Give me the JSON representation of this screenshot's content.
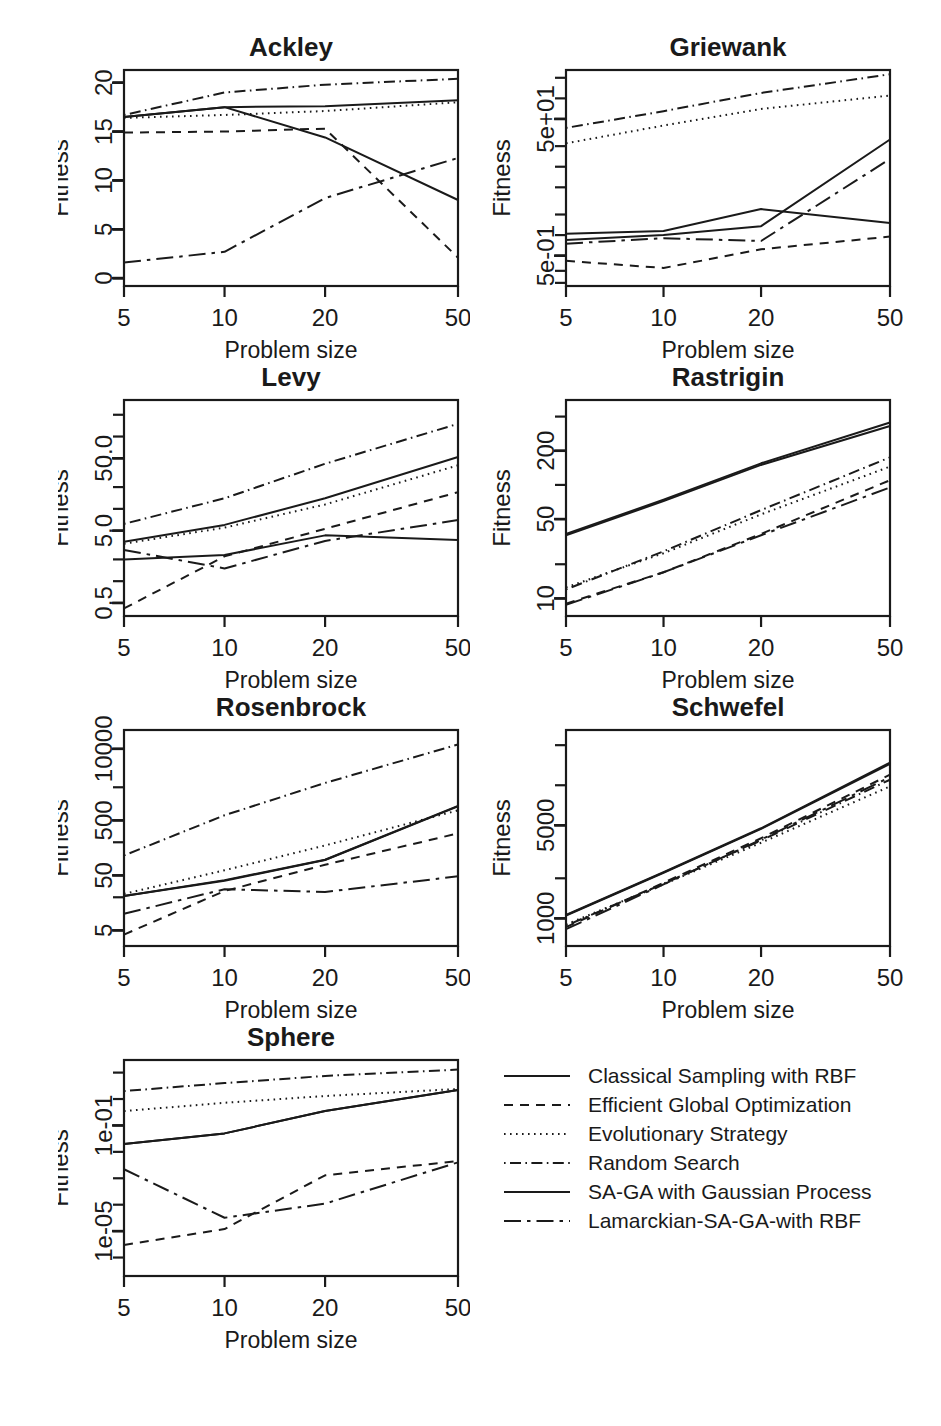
{
  "figure": {
    "width": 941,
    "height": 1426,
    "background": "#ffffff",
    "ink": "#1a1a1a",
    "xlabel": "Problem size",
    "ylabel": "Fitness",
    "x_categories": [
      "5",
      "10",
      "20",
      "50"
    ],
    "x_values": [
      5,
      10,
      20,
      50
    ]
  },
  "series_styles": [
    {
      "name": "Classical Sampling with RBF",
      "dash": "none",
      "pattern": "solid"
    },
    {
      "name": "Efficient Global Optimization",
      "dash": "8,7",
      "pattern": "dashed"
    },
    {
      "name": "Evolutionary Strategy",
      "dash": "2,5",
      "pattern": "dotted"
    },
    {
      "name": "Random Search",
      "dash": "2,5,10,5",
      "pattern": "dotdash"
    },
    {
      "name": "SA-GA with Gaussian Process",
      "dash": "none",
      "pattern": "longsolid"
    },
    {
      "name": "Lamarckian-SA-GA-with RBF",
      "dash": "16,6,3,6",
      "pattern": "twodash"
    }
  ],
  "legend": {
    "items": [
      "Classical Sampling with RBF",
      "Efficient Global Optimization",
      "Evolutionary Strategy",
      "Random Search",
      "SA-GA with Gaussian Process",
      "Lamarckian-SA-GA-with RBF"
    ]
  },
  "chart_data": [
    {
      "type": "line",
      "title": "Ackley",
      "xlabel": "Problem size",
      "ylabel": "Fitness",
      "x": [
        5,
        10,
        20,
        50
      ],
      "xscale": "log",
      "xticks": [
        5,
        10,
        20,
        50
      ],
      "xticklabels": [
        "5",
        "10",
        "20",
        "50"
      ],
      "yscale": "linear",
      "ylim": [
        -0.8,
        21.3
      ],
      "yticks": [
        0,
        5,
        10,
        15,
        20
      ],
      "yticklabels": [
        "0",
        "5",
        "10",
        "15",
        "20"
      ],
      "grid": false,
      "series": [
        {
          "name": "Classical Sampling with RBF",
          "values": [
            16.5,
            17.5,
            17.6,
            18.2
          ]
        },
        {
          "name": "Efficient Global Optimization",
          "values": [
            14.9,
            15.0,
            15.3,
            2.1
          ]
        },
        {
          "name": "Evolutionary Strategy",
          "values": [
            16.4,
            16.7,
            17.1,
            18.0
          ]
        },
        {
          "name": "Random Search",
          "values": [
            16.7,
            19.0,
            19.8,
            20.4
          ]
        },
        {
          "name": "SA-GA with Gaussian Process",
          "values": [
            16.5,
            17.5,
            14.4,
            8.0
          ]
        },
        {
          "name": "Lamarckian-SA-GA-with RBF",
          "values": [
            1.6,
            2.7,
            8.2,
            12.3
          ]
        }
      ]
    },
    {
      "type": "line",
      "title": "Griewank",
      "xlabel": "Problem size",
      "ylabel": "Fitness",
      "x": [
        5,
        10,
        20,
        50
      ],
      "xscale": "log",
      "xticks": [
        5,
        10,
        20,
        50
      ],
      "xticklabels": [
        "5",
        "10",
        "20",
        "50"
      ],
      "yscale": "log",
      "ylim": [
        0.18,
        260
      ],
      "yticks": [
        0.5,
        50
      ],
      "yticklabels": [
        "5e-01",
        "5e+01"
      ],
      "minor_yticks": [
        0.2,
        0.3,
        0.5,
        1,
        2,
        5,
        10,
        20,
        50,
        100,
        200
      ],
      "grid": false,
      "series": [
        {
          "name": "Classical Sampling with RBF",
          "values": [
            1.05,
            1.15,
            2.4,
            1.5
          ]
        },
        {
          "name": "Efficient Global Optimization",
          "values": [
            0.42,
            0.33,
            0.62,
            0.95
          ]
        },
        {
          "name": "Evolutionary Strategy",
          "values": [
            22.0,
            40.0,
            70.0,
            110.0
          ]
        },
        {
          "name": "Random Search",
          "values": [
            37.0,
            65.0,
            120.0,
            225.0
          ]
        },
        {
          "name": "SA-GA with Gaussian Process",
          "values": [
            0.85,
            1.0,
            1.35,
            25.0
          ]
        },
        {
          "name": "Lamarckian-SA-GA-with RBF",
          "values": [
            0.75,
            0.9,
            0.82,
            13.0
          ]
        }
      ]
    },
    {
      "type": "line",
      "title": "Levy",
      "xlabel": "Problem size",
      "ylabel": "Fitness",
      "x": [
        5,
        10,
        20,
        50
      ],
      "xscale": "log",
      "xticks": [
        5,
        10,
        20,
        50
      ],
      "xticklabels": [
        "5",
        "10",
        "20",
        "50"
      ],
      "yscale": "log",
      "ylim": [
        0.33,
        320
      ],
      "yticks": [
        0.5,
        5.0,
        50.0
      ],
      "yticklabels": [
        "0.5",
        "5.0",
        "50.0"
      ],
      "minor_yticks": [
        0.5,
        1,
        2,
        5,
        10,
        20,
        50,
        100,
        200
      ],
      "grid": false,
      "series": [
        {
          "name": "Classical Sampling with RBF",
          "values": [
            2.0,
            2.3,
            4.3,
            3.7
          ]
        },
        {
          "name": "Efficient Global Optimization",
          "values": [
            0.42,
            2.2,
            5.3,
            17.0
          ]
        },
        {
          "name": "Evolutionary Strategy",
          "values": [
            3.3,
            5.5,
            11.5,
            40.0
          ]
        },
        {
          "name": "Random Search",
          "values": [
            6.2,
            14.0,
            42.0,
            150.0
          ]
        },
        {
          "name": "SA-GA with Gaussian Process",
          "values": [
            3.5,
            6.0,
            14.0,
            52.0
          ]
        },
        {
          "name": "Lamarckian-SA-GA-with RBF",
          "values": [
            2.7,
            1.5,
            3.6,
            7.0
          ]
        }
      ]
    },
    {
      "type": "line",
      "title": "Rastrigin",
      "xlabel": "Problem size",
      "ylabel": "Fitness",
      "x": [
        5,
        10,
        20,
        50
      ],
      "xscale": "log",
      "xticks": [
        5,
        10,
        20,
        50
      ],
      "xticklabels": [
        "5",
        "10",
        "20",
        "50"
      ],
      "yscale": "log",
      "ylim": [
        7.0,
        560
      ],
      "yticks": [
        10,
        50,
        200
      ],
      "yticklabels": [
        "10",
        "50",
        "200"
      ],
      "minor_yticks": [
        10,
        20,
        50,
        100,
        200,
        400
      ],
      "grid": false,
      "series": [
        {
          "name": "Classical Sampling with RBF",
          "values": [
            36.0,
            72.0,
            150.0,
            330.0
          ]
        },
        {
          "name": "Efficient Global Optimization",
          "values": [
            9.0,
            17.0,
            37.0,
            110.0
          ]
        },
        {
          "name": "Evolutionary Strategy",
          "values": [
            12.5,
            25.0,
            55.0,
            145.0
          ]
        },
        {
          "name": "Random Search",
          "values": [
            12.0,
            26.0,
            60.0,
            175.0
          ]
        },
        {
          "name": "SA-GA with Gaussian Process",
          "values": [
            37.0,
            74.0,
            155.0,
            355.0
          ]
        },
        {
          "name": "Lamarckian-SA-GA-with RBF",
          "values": [
            8.8,
            17.0,
            36.0,
            95.0
          ]
        }
      ]
    },
    {
      "type": "line",
      "title": "Rosenbrock",
      "xlabel": "Problem size",
      "ylabel": "Fitness",
      "x": [
        5,
        10,
        20,
        50
      ],
      "xscale": "log",
      "xticks": [
        5,
        10,
        20,
        50
      ],
      "xticklabels": [
        "5",
        "10",
        "20",
        "50"
      ],
      "yscale": "log",
      "ylim": [
        2.6,
        22000
      ],
      "yticks": [
        5,
        50,
        500,
        10000
      ],
      "yticklabels": [
        "5",
        "50",
        "500",
        "10000"
      ],
      "minor_yticks": [
        5,
        20,
        50,
        200,
        500,
        2000,
        10000
      ],
      "grid": false,
      "series": [
        {
          "name": "Classical Sampling with RBF",
          "values": [
            21.0,
            40.0,
            95.0,
            900.0
          ]
        },
        {
          "name": "Efficient Global Optimization",
          "values": [
            4.2,
            26.0,
            78.0,
            290.0
          ]
        },
        {
          "name": "Evolutionary Strategy",
          "values": [
            23.0,
            62.0,
            175.0,
            760.0
          ]
        },
        {
          "name": "Random Search",
          "values": [
            115.0,
            620.0,
            2400.0,
            12000.0
          ]
        },
        {
          "name": "SA-GA with Gaussian Process",
          "values": [
            21.0,
            41.0,
            96.0,
            920.0
          ]
        },
        {
          "name": "Lamarckian-SA-GA-with RBF",
          "values": [
            10.0,
            28.0,
            25.0,
            48.0
          ]
        }
      ]
    },
    {
      "type": "line",
      "title": "Schwefel",
      "xlabel": "Problem size",
      "ylabel": "Fitness",
      "x": [
        5,
        10,
        20,
        50
      ],
      "xscale": "log",
      "xticks": [
        5,
        10,
        20,
        50
      ],
      "xticklabels": [
        "5",
        "10",
        "20",
        "50"
      ],
      "yscale": "log",
      "ylim": [
        620,
        26000
      ],
      "yticks": [
        1000,
        5000
      ],
      "yticklabels": [
        "1000",
        "5000"
      ],
      "minor_yticks": [
        1000,
        2000,
        5000,
        10000,
        20000
      ],
      "grid": false,
      "series": [
        {
          "name": "Classical Sampling with RBF",
          "values": [
            1050,
            2200,
            4700,
            14500
          ]
        },
        {
          "name": "Efficient Global Optimization",
          "values": [
            860,
            1850,
            4000,
            12000
          ]
        },
        {
          "name": "Evolutionary Strategy",
          "values": [
            900,
            1800,
            3700,
            9800
          ]
        },
        {
          "name": "Random Search",
          "values": [
            880,
            1820,
            3850,
            11000
          ]
        },
        {
          "name": "SA-GA with Gaussian Process",
          "values": [
            1060,
            2220,
            4750,
            14800
          ]
        },
        {
          "name": "Lamarckian-SA-GA-with RBF",
          "values": [
            830,
            1800,
            3900,
            11500
          ]
        }
      ]
    },
    {
      "type": "line",
      "title": "Sphere",
      "xlabel": "Problem size",
      "ylabel": "Fitness",
      "x": [
        5,
        10,
        20,
        50
      ],
      "xscale": "log",
      "xticks": [
        5,
        10,
        20,
        50
      ],
      "xticklabels": [
        "5",
        "10",
        "20",
        "50"
      ],
      "yscale": "log",
      "ylim": [
        2e-07,
        30
      ],
      "yticks": [
        1e-05,
        0.1
      ],
      "yticklabels": [
        "1e-05",
        "1e-01"
      ],
      "minor_yticks": [
        1e-06,
        1e-05,
        0.0001,
        0.001,
        0.01,
        0.1,
        1,
        10
      ],
      "grid": false,
      "series": [
        {
          "name": "Classical Sampling with RBF",
          "values": [
            0.02,
            0.05,
            0.35,
            2.2
          ]
        },
        {
          "name": "Efficient Global Optimization",
          "values": [
            3e-06,
            1.2e-05,
            0.0013,
            0.0045
          ]
        },
        {
          "name": "Evolutionary Strategy",
          "values": [
            0.35,
            0.72,
            1.3,
            2.4
          ]
        },
        {
          "name": "Random Search",
          "values": [
            2.0,
            4.0,
            7.5,
            13.0
          ]
        },
        {
          "name": "SA-GA with Gaussian Process",
          "values": [
            0.02,
            0.05,
            0.35,
            2.2
          ]
        },
        {
          "name": "Lamarckian-SA-GA-with RBF",
          "values": [
            0.0022,
            3.2e-05,
            0.00011,
            0.004
          ]
        }
      ]
    }
  ]
}
